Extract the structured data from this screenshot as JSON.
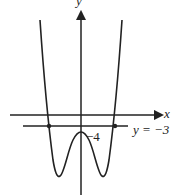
{
  "diagram": {
    "axes": {
      "x_label": "x",
      "y_label": "y"
    },
    "annotations": {
      "y_intercept_label": "−4",
      "line_label": "y = −3"
    },
    "curve": {
      "description": "W-shaped quartic graph symmetric about the y-axis with local maximum at (0,-4) and two local minima below",
      "local_max": [
        0,
        -4
      ]
    },
    "horizontal_line": {
      "y": -3
    },
    "intersection_points": 2,
    "colors": {
      "stroke": "#222222",
      "background": "#ffffff"
    }
  }
}
